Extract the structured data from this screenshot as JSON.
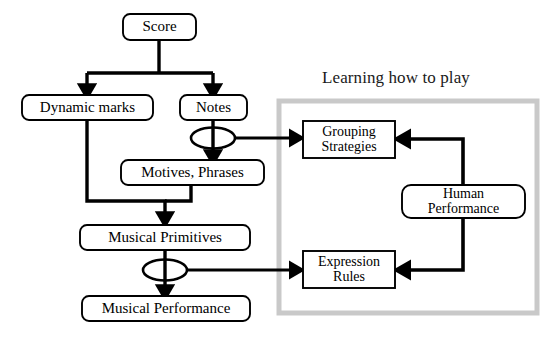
{
  "figure": {
    "background_color": "#ffffff",
    "line_color": "#000000",
    "group_border_color": "#c9c9c9",
    "group_title": "Learning how to play"
  },
  "nodes": {
    "score": {
      "label": "Score",
      "shape": "rounded-rect"
    },
    "dynamic_marks": {
      "label": "Dynamic marks",
      "shape": "rounded-rect"
    },
    "notes": {
      "label": "Notes",
      "shape": "rounded-rect"
    },
    "motives_phrases": {
      "label": "Motives, Phrases",
      "shape": "rounded-rect"
    },
    "musical_primitives": {
      "label": "Musical Primitives",
      "shape": "rounded-rect"
    },
    "musical_performance": {
      "label": "Musical Performance",
      "shape": "rounded-rect"
    },
    "grouping_strategies": {
      "label": "Grouping\nStrategies",
      "shape": "rect"
    },
    "expression_rules": {
      "label": "Expression\nRules",
      "shape": "rect"
    },
    "human_performance": {
      "label": "Human\nPerformance",
      "shape": "rounded-rect"
    }
  },
  "junctions": {
    "notes_junction": {
      "shape": "ellipse"
    },
    "primitives_junction": {
      "shape": "ellipse"
    }
  },
  "edges": [
    {
      "from": "score",
      "to": "dynamic_marks",
      "arrow": true
    },
    {
      "from": "score",
      "to": "notes",
      "arrow": true
    },
    {
      "from": "notes",
      "to": "motives_phrases",
      "arrow": true
    },
    {
      "from": "notes_junction",
      "to": "grouping_strategies",
      "arrow": true
    },
    {
      "from": "dynamic_marks",
      "to": "musical_primitives",
      "arrow": true
    },
    {
      "from": "motives_phrases",
      "to": "musical_primitives",
      "arrow": true
    },
    {
      "from": "musical_primitives",
      "to": "musical_performance",
      "arrow": true
    },
    {
      "from": "primitives_junction",
      "to": "expression_rules",
      "arrow": true
    },
    {
      "from": "human_performance",
      "to": "grouping_strategies",
      "arrow": true
    },
    {
      "from": "human_performance",
      "to": "expression_rules",
      "arrow": true
    }
  ]
}
